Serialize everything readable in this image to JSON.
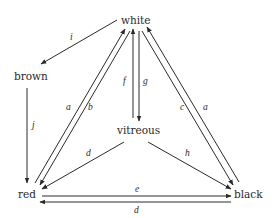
{
  "diagram": {
    "type": "state-transition",
    "nodes": [
      {
        "id": "white",
        "label": "white"
      },
      {
        "id": "brown",
        "label": "brown"
      },
      {
        "id": "vitreous",
        "label": "vitreous"
      },
      {
        "id": "red",
        "label": "red"
      },
      {
        "id": "black",
        "label": "black"
      }
    ],
    "edges": [
      {
        "id": "i",
        "label": "i",
        "from": "white",
        "to": "brown"
      },
      {
        "id": "j",
        "label": "j",
        "from": "brown",
        "to": "red"
      },
      {
        "id": "a_left",
        "label": "a",
        "from": "red",
        "to": "white"
      },
      {
        "id": "b",
        "label": "b",
        "from": "white",
        "to": "red"
      },
      {
        "id": "f",
        "label": "f",
        "from": "vitreous",
        "to": "white"
      },
      {
        "id": "g",
        "label": "g",
        "from": "white",
        "to": "vitreous"
      },
      {
        "id": "c",
        "label": "c",
        "from": "white",
        "to": "black"
      },
      {
        "id": "a_right",
        "label": "a",
        "from": "black",
        "to": "white"
      },
      {
        "id": "d_vit",
        "label": "d",
        "from": "vitreous",
        "to": "red"
      },
      {
        "id": "h",
        "label": "h",
        "from": "vitreous",
        "to": "black"
      },
      {
        "id": "e",
        "label": "e",
        "from": "red",
        "to": "black"
      },
      {
        "id": "d_bottom",
        "label": "d",
        "from": "black",
        "to": "red"
      }
    ]
  }
}
